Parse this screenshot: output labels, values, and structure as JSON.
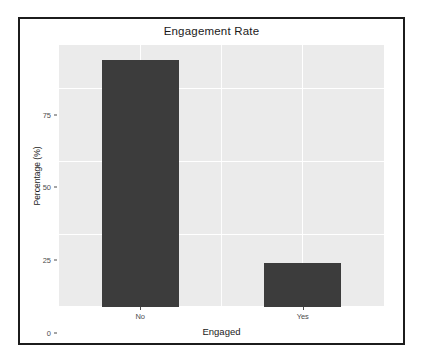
{
  "chart_data": {
    "type": "bar",
    "title": "Engagement Rate",
    "xlabel": "Engaged",
    "ylabel": "Percentage (%)",
    "categories": [
      "No",
      "Yes"
    ],
    "values": [
      85,
      15
    ],
    "ylim": [
      0,
      90
    ],
    "y_ticks": [
      0,
      25,
      50,
      75
    ],
    "y_tick_labels": [
      "0",
      "25",
      "50",
      "75"
    ],
    "grid": true,
    "grid_minor": true,
    "legend": "none",
    "bar_color": "#3c3c3c",
    "panel_background": "#ebebeb",
    "gridline_color": "#ffffff",
    "axis_text_color": "#4d4d4d",
    "title_color": "#1a1a1a",
    "frame_color": "#1c1c1c"
  }
}
